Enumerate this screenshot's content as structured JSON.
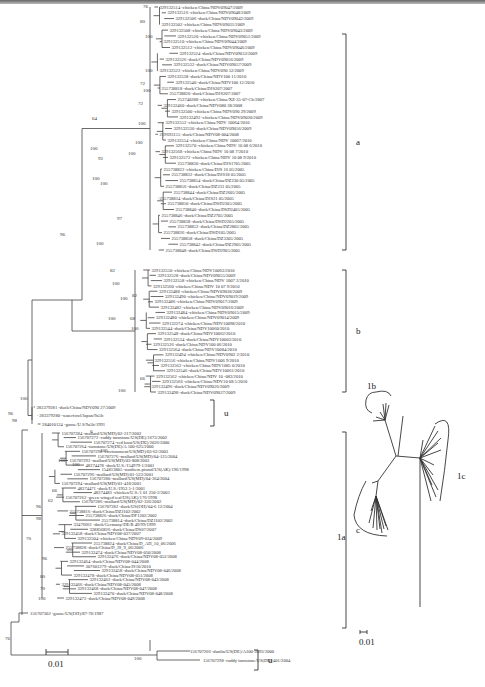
{
  "figure": {
    "type": "phylogenetic-tree",
    "left_panel": {
      "clades": [
        {
          "label": "a",
          "top": 34,
          "bottom": 250
        },
        {
          "label": "b",
          "top": 270,
          "bottom": 392
        },
        {
          "label": "u",
          "top": 400,
          "bottom": 426
        },
        {
          "label": "c",
          "top": 432,
          "bottom": 628
        },
        {
          "label": "u",
          "top": 650,
          "bottom": 670
        }
      ],
      "leaves_a": [
        "329132514 -chicken/China/NDV09047/2009",
        "329132516 -chicken/China/NDV09048/2009",
        "329132506 -duck/China/NDV09042/2009",
        "329132502 -chicken/China/NDV09031/2009",
        "329132508 -chicken/China/NDV09043/2009",
        "329132520 -chicken/China/NDV09051/2009",
        "329132510 -chicken/China/NDV09044/2009",
        "329132512 -chicken/China/NDV09046/2009",
        "329132524 -duck/China/NDV09053/2009",
        "329132526 -duck/China/NDV09056/2009",
        "329132532 -duck/China/NDV09057/2009",
        "329132522 -chicken/China/NDV090 52/2009",
        "329132538 -duck/China/NDV100 11/2010",
        "329132540 -duck/China/NDV100 12/2010",
        "255738818 -duck/China/DJS207/2007",
        "255738820 -duck/China/DJS207/2007",
        "253740288 -chicken/China/XZ-35-07-Ch/2007",
        "329132460 -duck/China/NDV080 38/2008",
        "329132500 -chicken/China/NDV090 29/2009",
        "329132492 -chicken/China/NDV09020/2009",
        "329132552 -chicken/China/NDV 10064/2010",
        "329132530 -duck/China/NDV09056/2009",
        "219693155 -duck/China/NDV08-004/2008",
        "329132554 -chicken/China/NDV 10067/2010",
        "329132570 -chicken/China/NDV 10 08 6/2010",
        "329132568 -chicken/China/NDV 10 08 7/2010",
        "329132572 -chicken/China/NDV 10 08 9/2010",
        "255738830 -duck/China/DJS1705/2005",
        "255738822 -chicken/China/DJS 16 05/2005",
        "255738832 -duck/China/DJS18 05/2005",
        "255738854 -duck/China/DZ230 05/2005",
        "255738856 -duck/China/DZ231 05/2005",
        "255738844 -duck/China/DZ2605/2005",
        "255738834 -duck/China/DJS21 05/2005",
        "255738850 -duck/China/DSD2305/2005",
        "255738840 -duck/China/DSD2405/2005",
        "255738846 -duck/China/DZ2705/2005",
        "255738838 -duck/China/DSD2205/2005",
        "255738852 -duck/China/DZ2805/2005",
        "255738836 -duck/China/DSD105/2005",
        "255738858 -duck/China/DZ3305/2005",
        "255738842 -duck/China/DZ2905/2005",
        "255738848 -duck/China/DSD2905/2005"
      ],
      "leaves_b": [
        "329132550 -chicken/China/NDV10063/2010",
        "329132528 -duck/China/NDV09055/2009",
        "329132558 -chicken/China/NDV 1007 2/2010",
        "329132560 -chicken/China/NDV 10 07 9/2010",
        "329132488 -chicken/China/NDV09018/2009",
        "329132490 -chicken/China/NDV09019/2009",
        "329132486 -chicken/China/NDV09017/2009",
        "329132482 -chicken/China/NDV09016/2009",
        "329132484 -chicken/China/NDV09015/2009",
        "329132480 -chicken/China/NDV09014/2009",
        "329132274 -chicken/China/NDV10098/2010",
        "329132544 -duck/China/NDV10060/2010",
        "329132548 -duck/China/NDV10062/2010",
        "329132534 -duck/China/NDV10003/2010",
        "329132536 -duck/China/NDV100 06/2010",
        "329132564 -duck/China/NDV10084/2010",
        "329132494 -chicken/China/NDV0902 2/2010",
        "329132556 -chicken/China/NDV1006 9/2010",
        "329132562 -chicken/China/NDV1085 0/2010",
        "329132546 -duck/China/NDV10061/2010",
        "329132562 -chicken/China/NDV 10 -083/2010",
        "329132566 -chicken/China/NDV10 08 5/2010",
        "329132496 -duck/China/NDV09026/2009",
        "329132498 -duck/China/NDV09027/2009"
      ],
      "leaves_u1": [
        "283379281 -duck/China/NDV090 27/2009",
        "283379280 -waterfowl/Japan/9a5b",
        "284010124 -goose/U.S/9a5b/1991"
      ],
      "leaves_c": [
        "156707284 -mallard/US(MD)/02-217/2002",
        "156707272 -ruddy turnstone/US(DE)/1673/2002",
        "156707274 -red knot/US(DE)/2026/2000",
        "156707264 -turnstone/US(DE)/A 100-625/2000",
        "156707290 -environment/US(MD)/03-62/2003",
        "156707276 -mallard/US(MD)/04-125/2004",
        "156707292 -mallard/US(MD)/03-808/2003",
        "48374478 -duck/U.S./154979-1/2001",
        "154813805 -northern pintail/US(AK)/196/1998",
        "156707296 -mallard/US(MD)/01-523/2001",
        "156707280 -mallard/US(MD)/04-364/2004",
        "156707294 -mallard/US(MD)/01-418/2001",
        "48374471 -duck/U.S./1953 5-1/2001",
        "48374483 -chicken/U.S./1 01 250-2/2001",
        "156707262 -green winged teal/US(AK)/176/1998",
        "156707286 -mallard/US(MD)/02-336/2002",
        "156707282 -duck/US(OH)/04-6 12/2004",
        "255738816 -duck/China/DZJ102/2002",
        "255738826 -duck/China/DF1202/2002",
        "255738814 -duck/China/DZJ102/2002",
        "33476661 -duck/Germany/DE/R 49/99/1999",
        "328856826 -duck/China/DS07/2007",
        "329132458 -duck/China/NDV08-037/2007",
        "329132504 -chicken/China/NDV09-034/2009",
        "255738824 -duck/China/D_AH_10_06/2006",
        "255738828 -duck/China/D_JS_9_06/2006",
        "329132474 -duck/China/NDV08-050/2008",
        "329132476 -duck/China/NDV08-052/2008",
        "329132464 -duck/China/NDV08-044/2008",
        "307601279 -duck/China/JS10/2010",
        "329132458 -duck/China/NDV08-046/2008",
        "329132478 -duck/China/NDV08-051/2008",
        "329132462 -duck/China/NDV08-043/2008",
        "329132466 -duck/China/NDV08-045/2008",
        "329132468 -duck/China/NDV08-047/2008",
        "329132470 -duck/China/NDV08-048/2008",
        "329132472 -duck/China/NDV08-049/2008"
      ],
      "outgroup": "156707302 -goose/US(OH)/87-78/1987",
      "leaves_u2": [
        "156707266 -dunlin/US(DE)/A100-2093/2000",
        "156707298 -ruddy turnstone/US(DE)/401/2004"
      ],
      "bootstraps": [
        "76",
        "100",
        "80",
        "100",
        "72",
        "100",
        "72",
        "100",
        "100",
        "100",
        "64",
        "100",
        "92",
        "100",
        "100",
        "97",
        "100",
        "96",
        "82",
        "100",
        "100",
        "82",
        "100",
        "68",
        "100",
        "66",
        "100",
        "100",
        "96",
        "98",
        "0",
        "100",
        "100",
        "66",
        "100",
        "96",
        "62",
        "98",
        "70",
        "96",
        "80",
        "70",
        "100",
        "76",
        "100"
      ],
      "scale_bar": "0.01"
    },
    "right_panel": {
      "type": "unrooted-tree",
      "clades": [
        "1a",
        "1b",
        "1c"
      ],
      "scale_bar": "0.01"
    }
  }
}
